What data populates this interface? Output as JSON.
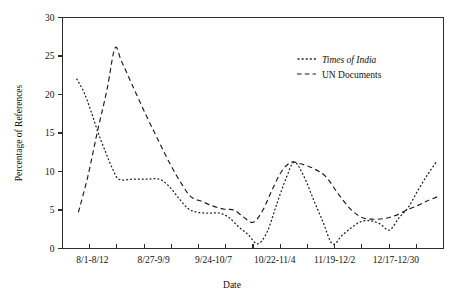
{
  "chart_data": {
    "type": "line",
    "title": "",
    "xlabel": "Date",
    "ylabel": "Percentage of References",
    "ylim": [
      0,
      30
    ],
    "yticks": [
      0,
      5,
      10,
      15,
      20,
      25,
      30
    ],
    "ytick_labels": [
      "0",
      "5",
      "10",
      "15",
      "20",
      "25",
      "30"
    ],
    "xtick_labels": [
      "8/1-8/12",
      "8/27-9/9",
      "9/24-10/7",
      "10/22-11/4",
      "11/19-12/2",
      "12/17-12/30"
    ],
    "xtick_label_positions": [
      1,
      4,
      7,
      10,
      13,
      16
    ],
    "grid": false,
    "legend_position": "top-right",
    "x_tick_count": 13,
    "x_index_range": [
      0,
      18
    ],
    "series": [
      {
        "name": "Times of India",
        "style": "dotted",
        "italic_label": true,
        "x": [
          0.9,
          1.4,
          1.9,
          2.4,
          2.9,
          3.4,
          3.9,
          4.4,
          5.1,
          5.9,
          6.6,
          7.3,
          7.9,
          8.5,
          9.1,
          9.6,
          10.1,
          10.6,
          11.2,
          11.8,
          12.4,
          13.0,
          13.6,
          14.2,
          14.9,
          15.6,
          16.3,
          17.0,
          17.6
        ],
        "values": [
          22.0,
          20.3,
          17.8,
          15.0,
          12.5,
          10.6,
          9.0,
          9.0,
          9.0,
          9.0,
          8.2,
          6.9,
          5.3,
          4.7,
          4.6,
          4.6,
          4.0,
          2.9,
          1.9,
          0.6,
          2.0,
          5.6,
          9.1,
          11.2,
          9.5,
          6.6,
          3.6,
          0.6,
          1.6
        ],
        "values_tail_x": [
          18.0,
          18.6,
          19.2,
          19.8,
          20.4,
          21.0
        ],
        "values_tail": [
          2.6,
          3.4,
          3.6,
          3.3,
          2.4,
          3.9
        ]
      },
      {
        "name": "UN Documents",
        "style": "dashed",
        "italic_label": false,
        "x": [
          1.0,
          1.6,
          2.2,
          2.7,
          3.2,
          3.8,
          4.4,
          5.1,
          5.8,
          6.5,
          7.2,
          7.9,
          8.5,
          9.2,
          9.9,
          10.5,
          11.1,
          11.7,
          12.4,
          13.1,
          13.8,
          14.5,
          15.2,
          15.9,
          16.6,
          17.3,
          18.0
        ],
        "values": [
          4.7,
          9.4,
          15.2,
          20.5,
          26.0,
          24.4,
          21.0,
          17.5,
          14.0,
          10.8,
          8.5,
          6.7,
          6.1,
          5.6,
          5.1,
          5.0,
          4.2,
          3.4,
          5.0,
          7.8,
          10.1,
          11.2,
          10.9,
          10.4,
          9.3,
          7.2,
          5.0
        ]
      }
    ],
    "points_times_of_india": [
      {
        "x": 0.9,
        "y": 22.0
      },
      {
        "x": 1.35,
        "y": 20.3
      },
      {
        "x": 1.8,
        "y": 17.8
      },
      {
        "x": 2.25,
        "y": 15.0
      },
      {
        "x": 2.7,
        "y": 12.6
      },
      {
        "x": 3.1,
        "y": 10.6
      },
      {
        "x": 3.55,
        "y": 9.0
      },
      {
        "x": 4.4,
        "y": 9.0
      },
      {
        "x": 5.3,
        "y": 9.0
      },
      {
        "x": 6.1,
        "y": 9.0
      },
      {
        "x": 6.7,
        "y": 8.1
      },
      {
        "x": 7.3,
        "y": 6.6
      },
      {
        "x": 7.9,
        "y": 5.2
      },
      {
        "x": 8.5,
        "y": 4.7
      },
      {
        "x": 9.2,
        "y": 4.6
      },
      {
        "x": 9.9,
        "y": 4.6
      },
      {
        "x": 10.5,
        "y": 4.0
      },
      {
        "x": 11.1,
        "y": 2.8
      },
      {
        "x": 11.7,
        "y": 1.8
      },
      {
        "x": 12.3,
        "y": 0.6
      },
      {
        "x": 12.9,
        "y": 2.2
      },
      {
        "x": 13.5,
        "y": 5.8
      },
      {
        "x": 14.1,
        "y": 9.2
      },
      {
        "x": 14.6,
        "y": 11.2
      },
      {
        "x": 15.2,
        "y": 9.4
      },
      {
        "x": 15.8,
        "y": 6.4
      },
      {
        "x": 16.4,
        "y": 3.5
      },
      {
        "x": 17.0,
        "y": 0.6
      },
      {
        "x": 17.6,
        "y": 1.7
      },
      {
        "x": 18.2,
        "y": 2.7
      },
      {
        "x": 18.8,
        "y": 3.5
      },
      {
        "x": 19.4,
        "y": 3.6
      },
      {
        "x": 20.0,
        "y": 3.2
      },
      {
        "x": 20.6,
        "y": 2.4
      },
      {
        "x": 21.2,
        "y": 4.0
      },
      {
        "x": 21.8,
        "y": 5.4
      },
      {
        "x": 22.4,
        "y": 7.6
      },
      {
        "x": 23.0,
        "y": 9.6
      },
      {
        "x": 23.6,
        "y": 11.4
      }
    ],
    "points_un_documents": [
      {
        "x": 1.0,
        "y": 4.7
      },
      {
        "x": 1.6,
        "y": 9.4
      },
      {
        "x": 2.2,
        "y": 15.2
      },
      {
        "x": 2.8,
        "y": 20.6
      },
      {
        "x": 3.3,
        "y": 26.0
      },
      {
        "x": 3.7,
        "y": 24.4
      },
      {
        "x": 4.4,
        "y": 21.2
      },
      {
        "x": 5.2,
        "y": 17.6
      },
      {
        "x": 6.0,
        "y": 14.2
      },
      {
        "x": 6.8,
        "y": 10.9
      },
      {
        "x": 7.5,
        "y": 8.4
      },
      {
        "x": 8.1,
        "y": 6.7
      },
      {
        "x": 8.8,
        "y": 6.1
      },
      {
        "x": 9.5,
        "y": 5.5
      },
      {
        "x": 10.2,
        "y": 5.1
      },
      {
        "x": 10.8,
        "y": 5.0
      },
      {
        "x": 11.4,
        "y": 4.1
      },
      {
        "x": 12.0,
        "y": 3.4
      },
      {
        "x": 12.6,
        "y": 4.9
      },
      {
        "x": 13.2,
        "y": 7.6
      },
      {
        "x": 13.8,
        "y": 10.0
      },
      {
        "x": 14.4,
        "y": 11.2
      },
      {
        "x": 15.0,
        "y": 11.0
      },
      {
        "x": 15.8,
        "y": 10.4
      },
      {
        "x": 16.6,
        "y": 9.3
      },
      {
        "x": 17.4,
        "y": 7.0
      },
      {
        "x": 18.2,
        "y": 5.0
      },
      {
        "x": 18.9,
        "y": 4.0
      },
      {
        "x": 19.6,
        "y": 3.8
      },
      {
        "x": 20.3,
        "y": 3.9
      },
      {
        "x": 21.0,
        "y": 4.3
      },
      {
        "x": 21.7,
        "y": 5.0
      },
      {
        "x": 22.4,
        "y": 5.6
      },
      {
        "x": 23.0,
        "y": 6.2
      },
      {
        "x": 23.6,
        "y": 6.7
      }
    ]
  },
  "axes": {
    "y_title": "Percentage of References",
    "x_title": "Date",
    "y_tick_labels": [
      "30",
      "25",
      "20",
      "15",
      "10",
      "5",
      "0"
    ],
    "x_tick_labels": [
      "8/1-8/12",
      "8/27-9/9",
      "9/24-10/7",
      "10/22-11/4",
      "11/19-12/2",
      "12/17-12/30"
    ]
  },
  "legend": {
    "items": [
      {
        "label": "Times of India",
        "style": "dotted"
      },
      {
        "label": "UN Documents",
        "style": "dashed"
      }
    ]
  },
  "colors": {
    "ink": "#1b1b1b",
    "axis": "#2b2b2b",
    "background": "#ffffff"
  }
}
